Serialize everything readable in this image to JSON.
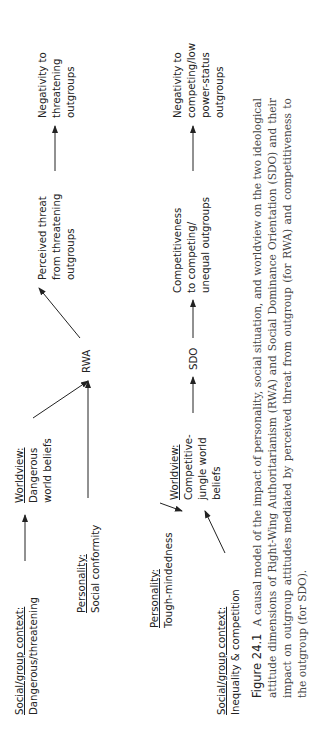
{
  "diagram": {
    "nodes": {
      "social_dangerous": {
        "head": "Social/group context:",
        "lines": [
          "Dangerous/threatening"
        ]
      },
      "personality_conformity": {
        "head": "Personality:",
        "lines": [
          "Social conformity"
        ]
      },
      "personality_tough": {
        "head": "Personality:",
        "lines": [
          "Tough-mindedness"
        ]
      },
      "social_inequality": {
        "head": "Social/group context:",
        "lines": [
          "Inequality & competition"
        ]
      },
      "worldview_dangerous": {
        "head": "Worldview:",
        "lines": [
          "Dangerous",
          "world beliefs"
        ]
      },
      "worldview_competitive": {
        "head": "Worldview:",
        "lines": [
          "Competitive-",
          "jungle world",
          "beliefs"
        ]
      },
      "rwa": {
        "lines": [
          "RWA"
        ]
      },
      "sdo": {
        "lines": [
          "SDO"
        ]
      },
      "perceived_threat": {
        "lines": [
          "Perceived threat",
          "from threatening",
          "outgroups"
        ]
      },
      "competitiveness": {
        "lines": [
          "Competitiveness",
          "to competing/",
          "unequal outgroups"
        ]
      },
      "negativity_threatening": {
        "lines": [
          "Negativity to",
          "threatening",
          "outgroups"
        ]
      },
      "negativity_competing": {
        "lines": [
          "Negativity to",
          "competing/low",
          "power-status",
          "outgroups"
        ]
      }
    },
    "edges": [
      {
        "from": "social_dangerous",
        "to": "worldview_dangerous"
      },
      {
        "from": "worldview_dangerous",
        "to": "rwa"
      },
      {
        "from": "personality_conformity",
        "to": "rwa"
      },
      {
        "from": "rwa",
        "to": "perceived_threat"
      },
      {
        "from": "perceived_threat",
        "to": "negativity_threatening"
      },
      {
        "from": "personality_tough",
        "to": "worldview_competitive"
      },
      {
        "from": "social_inequality",
        "to": "worldview_competitive"
      },
      {
        "from": "worldview_competitive",
        "to": "sdo"
      },
      {
        "from": "sdo",
        "to": "competitiveness"
      },
      {
        "from": "competitiveness",
        "to": "negativity_competing"
      }
    ]
  },
  "caption": {
    "label": "Figure 24.1",
    "text": "A causal model of the impact of personality, social situation, and worldview on the two ideological attitude dimensions of Right-Wing Authoritarianism (RWA) and Social Dominance Orientation (SDO) and their impact on outgroup attitudes mediated by perceived threat from outgroup (for RWA) and competitiveness to the outgroup (for SDO)."
  }
}
